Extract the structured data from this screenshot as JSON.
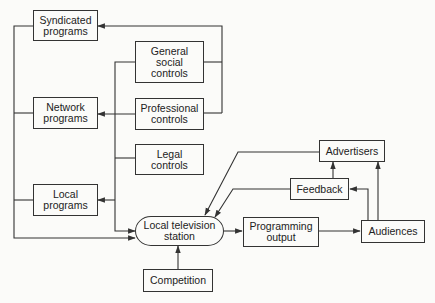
{
  "diagram": {
    "nodes": {
      "syndicated_programs": {
        "label": "Syndicated\nprograms"
      },
      "network_programs": {
        "label": "Network\nprograms"
      },
      "local_programs": {
        "label": "Local\nprograms"
      },
      "general_social_controls": {
        "label": "General\nsocial\ncontrols"
      },
      "professional_controls": {
        "label": "Professional\ncontrols"
      },
      "legal_controls": {
        "label": "Legal\ncontrols"
      },
      "local_television_station": {
        "label": "Local television\nstation"
      },
      "competition": {
        "label": "Competition"
      },
      "programming_output": {
        "label": "Programming\noutput"
      },
      "audiences": {
        "label": "Audiences"
      },
      "feedback": {
        "label": "Feedback"
      },
      "advertisers": {
        "label": "Advertisers"
      }
    },
    "edges": [
      {
        "from": "general_social_controls",
        "to": "syndicated_programs"
      },
      {
        "from": "professional_controls",
        "to": "syndicated_programs"
      },
      {
        "from": "professional_controls",
        "to": "network_programs"
      },
      {
        "from": "general_social_controls",
        "to": "local_programs"
      },
      {
        "from": "legal_controls",
        "to": "local_programs"
      },
      {
        "from": "general_social_controls",
        "to": "local_television_station"
      },
      {
        "from": "syndicated_programs",
        "to": "local_television_station"
      },
      {
        "from": "network_programs",
        "to": "local_television_station"
      },
      {
        "from": "local_programs",
        "to": "local_television_station"
      },
      {
        "from": "competition",
        "to": "local_television_station"
      },
      {
        "from": "local_television_station",
        "to": "programming_output"
      },
      {
        "from": "programming_output",
        "to": "audiences"
      },
      {
        "from": "audiences",
        "to": "feedback"
      },
      {
        "from": "audiences",
        "to": "advertisers"
      },
      {
        "from": "feedback",
        "to": "advertisers"
      },
      {
        "from": "feedback",
        "to": "local_television_station"
      },
      {
        "from": "advertisers",
        "to": "local_television_station"
      }
    ],
    "colors": {
      "line": "#333333",
      "background": "#fbfbf9"
    }
  }
}
